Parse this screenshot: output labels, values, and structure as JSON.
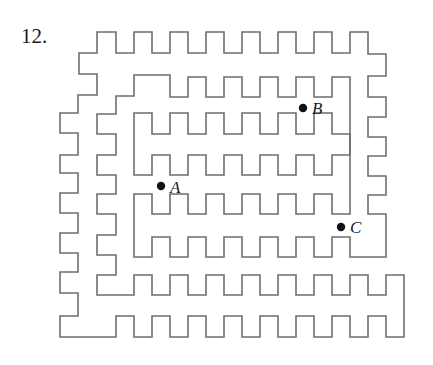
{
  "problem": {
    "number": "12."
  },
  "maze": {
    "stroke": "#6e6e6e",
    "walls": [
      "M97,32 L116,32 L116,53 L134,53 L134,32 L152,32 L152,53 L170,53 L170,32 L188,32 L188,53 L206,53 L206,32 L224,32 L224,53 L242,53 L242,32 L260,32 L260,53 L278,53 L278,32 L296,32 L296,53 L314,53 L314,32 L332,32 L332,53 L350,53 L350,32 L368,32 L368,54 L386,54 L386,76 L368,76 L368,97 L386,97 L386,117 L368,117 L368,137 L386,137 L386,156 L368,156 L368,176 L386,176 L386,195 L368,195 L368,214 L386,214 L386,257 L350,257 L350,237 L332,237 L332,257 L314,257 L314,237 L296,237 L296,257 L278,257 L278,237 L260,237 L260,257 L242,257 L242,237 L224,237 L224,257 L206,257 L206,237 L188,237 L188,257 L170,257 L170,237 L152,237 L152,257 L134,257 L134,194 L152,194 L152,214 L170,214 L170,194 L188,194 L188,214 L206,214 L206,194 L224,194 L224,214 L242,214 L242,194 L260,194 L260,214 L278,214 L278,194 L296,194 L296,214 L314,214 L314,194 L332,194 L332,214 L350,214 L350,77 L332,77 L332,97 L314,97 L314,77 L296,77 L296,97 L278,97 L278,77 L260,77 L260,97 L242,97 L242,77 L224,77 L224,97 L206,97 L206,77 L188,77 L188,97 L170,97 L170,75 L134,75 L134,96 L116,96 L116,114 L97,114 L97,134 L116,134 L116,155 L97,155 L97,175 L116,175 L116,194 L97,194 L97,214 L116,214 L116,235 L97,235 L97,255 L116,255 L116,275 L97,275 L97,295 L134,295 L134,275 L152,275 L152,295 L170,295 L170,275 L188,275 L188,295 L206,295 L206,275 L224,275 L224,295 L242,295 L242,275 L260,275 L260,295 L278,295 L278,275 L296,275 L296,295 L314,295 L314,275 L332,275 L332,295 L350,295 L350,275 L368,275 L368,295 L386,295 L386,275 L404,275 L404,337 L386,337 L386,316 L368,316 L368,337 L350,337 L350,316 L332,316 L332,337 L314,337 L314,316 L296,316 L296,337 L278,337 L278,316 L260,316 L260,337 L242,337 L242,316 L224,316 L224,337 L206,337 L206,316 L188,316 L188,337 L170,337 L170,316 L152,316 L152,337 L134,337 L134,316 L116,316 L116,337 L60,337 L60,316 L78,316 L78,293 L60,293 L60,272 L78,272 L78,253 L60,253 L60,233 L78,233 L78,213 L60,213 L60,193 L78,193 L78,173 L60,173 L60,155 L78,155 L78,133 L60,133 L60,113 L78,113 L78,95 L97,95 L97,74 L79,74 L79,53 L97,53 Z",
      "M134,113 L152,113 L152,134 L170,134 L170,113 L188,113 L188,134 L206,134 L206,113 L224,113 L224,134 L242,134 L242,113 L260,113 L260,134 L278,134 L278,113 L296,113 L296,134 L314,134 L314,113 L332,113 L332,134 L350,134 L350,155 L332,155 L332,175 L314,175 L314,155 L296,155 L296,175 L278,175 L278,155 L260,155 L260,175 L242,175 L242,155 L224,155 L224,175 L206,175 L206,155 L188,155 L188,175 L170,175 L170,155 L152,155 L152,175 L134,175 Z"
    ],
    "points": [
      {
        "label": "A",
        "cx": 161,
        "cy": 186,
        "lx": 170,
        "ly": 193
      },
      {
        "label": "B",
        "cx": 303,
        "cy": 108,
        "lx": 312,
        "ly": 114
      },
      {
        "label": "C",
        "cx": 341,
        "cy": 227,
        "lx": 350,
        "ly": 233
      }
    ]
  }
}
